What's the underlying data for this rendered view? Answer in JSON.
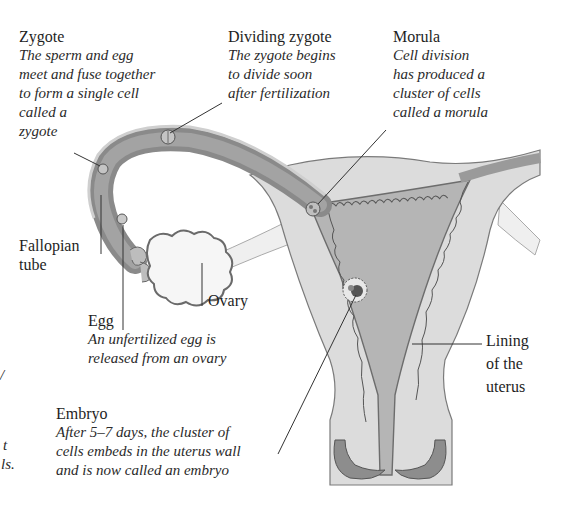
{
  "diagram": {
    "colors": {
      "background": "#ffffff",
      "tube_dark": "#8a8a8a",
      "tube_mid": "#a8a8a8",
      "uterus_outer": "#d9d9d9",
      "uterus_inner": "#bdbdbd",
      "lining": "#8f8f8f",
      "ovary": "#f4f4f4",
      "outline": "#555555",
      "leader_line": "#333333"
    },
    "labels": {
      "zygote": {
        "title": "Zygote",
        "description": "The sperm and egg\nmeet and fuse together\nto form a single cell\ncalled a\nzygote"
      },
      "dividing_zygote": {
        "title": "Dividing zygote",
        "description": "The zygote begins\nto divide soon\nafter fertilization"
      },
      "morula": {
        "title": "Morula",
        "description": "Cell division\nhas produced a\ncluster of cells\ncalled a morula"
      },
      "fallopian_tube": {
        "title": "Fallopian\ntube"
      },
      "ovary": {
        "title": "Ovary"
      },
      "egg": {
        "title": "Egg",
        "description": "An unfertilized egg is\nreleased from an ovary"
      },
      "lining": {
        "title": "Lining\nof the\nuterus"
      },
      "embryo": {
        "title": "Embryo",
        "description": "After 5–7 days, the cluster of\ncells embeds in the uterus wall\nand is now called an embryo"
      },
      "cropped_left": {
        "fragment_1": "/",
        "fragment_2": "t",
        "fragment_3": "ls."
      }
    }
  }
}
